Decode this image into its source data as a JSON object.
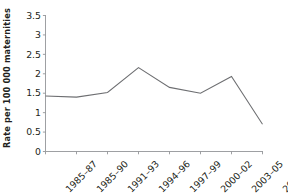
{
  "chart_data": {
    "type": "line",
    "title": "",
    "subtitle": "",
    "xlabel": "",
    "ylabel": "Rate per 100 000 maternities",
    "categories": [
      "1985–87",
      "1985–90",
      "1991–93",
      "1994–96",
      "1997–99",
      "2000–02",
      "2003–05",
      "2006–08"
    ],
    "values": [
      1.43,
      1.4,
      1.52,
      2.16,
      1.65,
      1.5,
      1.93,
      0.7
    ],
    "series": [
      {
        "name": "Rate per 100 000 maternities",
        "values": [
          1.43,
          1.4,
          1.52,
          2.16,
          1.65,
          1.5,
          1.93,
          0.7
        ]
      }
    ],
    "ylim": [
      0,
      3.5
    ],
    "ytick_values": [
      0,
      0.5,
      1,
      1.5,
      2,
      2.5,
      3,
      3.5
    ],
    "ytick_labels": [
      "0",
      "0.5",
      "1",
      "1.5",
      "2",
      "2.5",
      "3",
      "3.5"
    ],
    "grid": false,
    "legend": false,
    "legend_position": "none",
    "markers": false,
    "line_color": "#6d6e71",
    "axis_color": "#939598",
    "text_color": "#231f20",
    "background_color": "#ffffff",
    "annotations": []
  }
}
